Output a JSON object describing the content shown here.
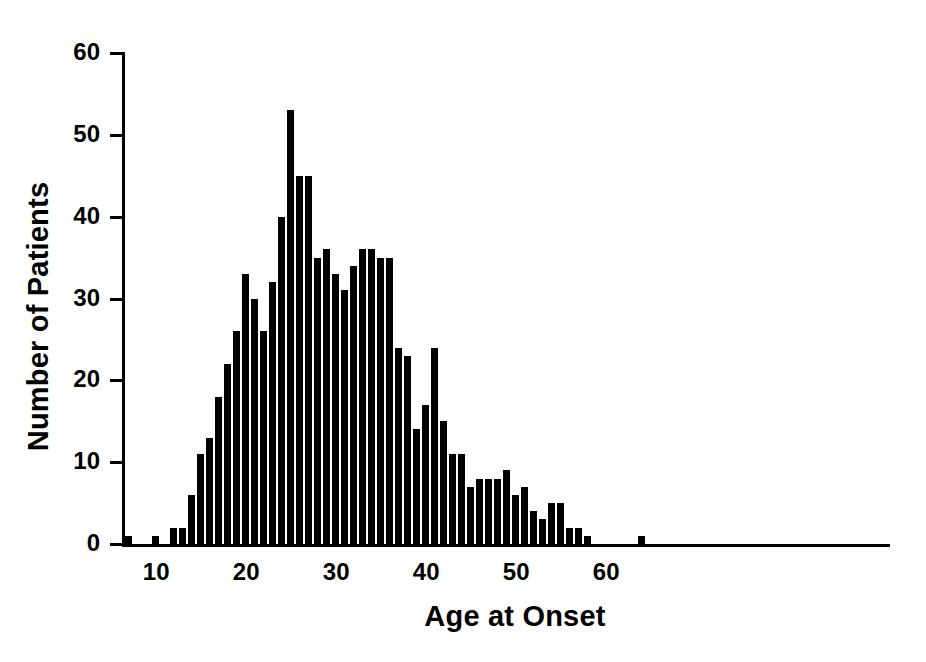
{
  "chart_data": {
    "type": "bar",
    "title": "",
    "subtitle": "",
    "xlabel": "Age at Onset",
    "ylabel": "Number of Patients",
    "xlim": [
      6,
      66
    ],
    "ylim": [
      0,
      60
    ],
    "grid": false,
    "legend": null,
    "bar_color": "#000000",
    "axis_color": "#000000",
    "x_tick_labels": [
      "10",
      "20",
      "30",
      "40",
      "50",
      "60"
    ],
    "x_tick_values": [
      10,
      20,
      30,
      40,
      50,
      60
    ],
    "y_tick_labels": [
      "0",
      "10",
      "20",
      "30",
      "40",
      "50",
      "60"
    ],
    "y_tick_values": [
      0,
      10,
      20,
      30,
      40,
      50,
      60
    ],
    "categories": [
      7,
      8,
      9,
      10,
      11,
      12,
      13,
      14,
      15,
      16,
      17,
      18,
      19,
      20,
      21,
      22,
      23,
      24,
      25,
      26,
      27,
      28,
      29,
      30,
      31,
      32,
      33,
      34,
      35,
      36,
      37,
      38,
      39,
      40,
      41,
      42,
      43,
      44,
      45,
      46,
      47,
      48,
      49,
      50,
      51,
      52,
      53,
      54,
      55,
      56,
      57,
      58,
      59,
      60,
      61,
      62,
      63,
      64
    ],
    "values": [
      1,
      0,
      0,
      1,
      0,
      2,
      2,
      6,
      11,
      13,
      18,
      22,
      26,
      33,
      30,
      26,
      32,
      40,
      53,
      45,
      45,
      35,
      36,
      33,
      31,
      34,
      36,
      36,
      35,
      35,
      24,
      23,
      14,
      17,
      24,
      15,
      11,
      11,
      7,
      8,
      8,
      8,
      9,
      6,
      7,
      4,
      3,
      5,
      5,
      2,
      2,
      1,
      0,
      0,
      0,
      0,
      0,
      1
    ],
    "series_name": "Patients"
  },
  "axis": {
    "ylabel": "Number of Patients",
    "xlabel": "Age at Onset"
  }
}
